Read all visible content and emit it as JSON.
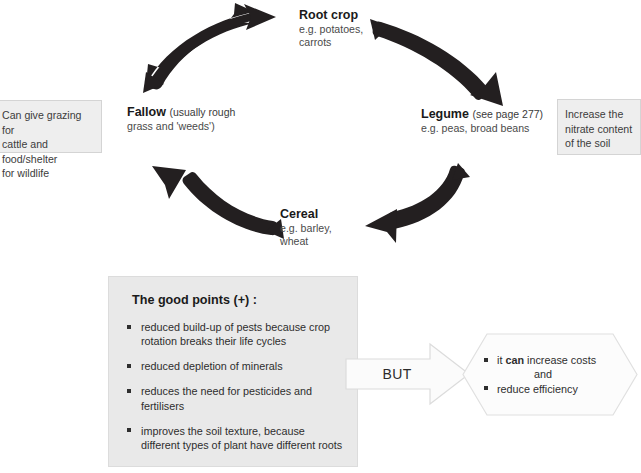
{
  "diagram": {
    "cycle_nodes": [
      {
        "id": "root-crop",
        "headline": "Root crop",
        "note": "",
        "sub_lines": [
          "e.g. potatoes,",
          "carrots"
        ]
      },
      {
        "id": "legume",
        "headline": "Legume",
        "note": "(see page 277)",
        "sub_lines": [
          "e.g. peas, broad beans"
        ]
      },
      {
        "id": "cereal",
        "headline": "Cereal",
        "note": "",
        "sub_lines": [
          "e.g. barley,",
          "wheat"
        ]
      },
      {
        "id": "fallow",
        "headline": "Fallow",
        "note": "(usually rough",
        "sub_lines": [
          "grass and 'weeds')"
        ]
      }
    ],
    "side_notes": [
      {
        "id": "fallow-note",
        "lines": [
          "Can give grazing for",
          "cattle and food/shelter",
          "for wildlife"
        ]
      },
      {
        "id": "legume-note",
        "lines": [
          "Increase the",
          "nitrate content",
          "of the soil"
        ]
      }
    ],
    "arrows": [
      {
        "id": "fallow-to-root-crop",
        "from": "fallow",
        "to": "root-crop"
      },
      {
        "id": "root-crop-to-legume",
        "from": "root-crop",
        "to": "legume"
      },
      {
        "id": "legume-to-cereal",
        "from": "legume",
        "to": "cereal"
      },
      {
        "id": "cereal-to-fallow",
        "from": "cereal",
        "to": "fallow"
      }
    ]
  },
  "good_points": {
    "title": "The good points (+) :",
    "items": [
      "reduced build-up of pests because crop rotation breaks their life cycles",
      "reduced depletion of minerals",
      "reduces the need for pesticides and fertilisers",
      "improves the soil texture, because different types of plant have different roots"
    ]
  },
  "but_arrow": {
    "label": "BUT"
  },
  "drawbacks": {
    "item_1_prefix": "it ",
    "item_1_emphasis": "can",
    "item_1_suffix": " increase costs",
    "connector": "and",
    "item_2": "reduce efficiency"
  },
  "colors": {
    "arrow_fill": "#231f20",
    "panel_background": "#e9e9e9",
    "note_background": "#eeeeee",
    "outline": "#d4d4d4",
    "text": "#2e2e2e"
  }
}
